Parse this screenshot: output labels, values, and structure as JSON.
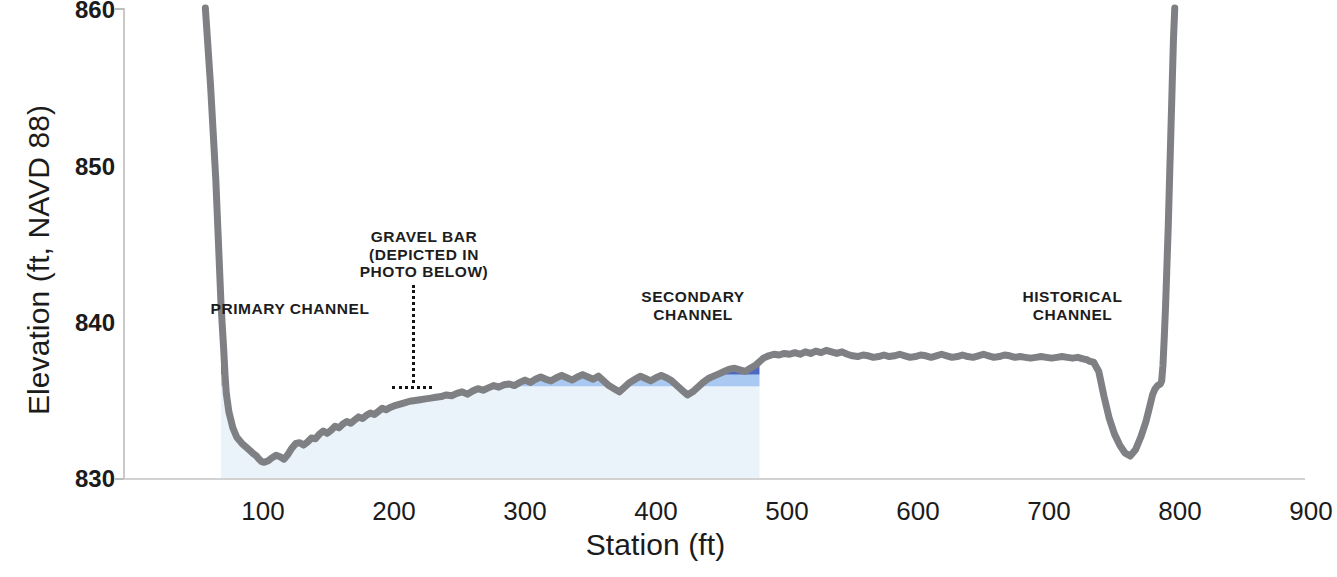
{
  "axes": {
    "y_title": "Elevation (ft, NAVD 88)",
    "x_title": "Station (ft)",
    "y_ticks": [
      "860",
      "850",
      "840",
      "830"
    ],
    "x_ticks": [
      "100",
      "200",
      "300",
      "400",
      "500",
      "600",
      "700",
      "800",
      "900"
    ]
  },
  "annotations": {
    "primary": "PRIMARY CHANNEL",
    "gravel_bar": "GRAVEL BAR\n(DEPICTED IN\nPHOTO BELOW)",
    "secondary": "SECONDARY\nCHANNEL",
    "historical": "HISTORICAL\nCHANNEL"
  },
  "colors": {
    "ground_line": "#7f8083",
    "water_top_navy": "#2d3357",
    "water_mid_blue": "#4a68c4",
    "water_light_blue": "#a9c8f2",
    "water_pale_blue": "#eaf2fa",
    "axis": "#c9c9c9",
    "text": "#1b1b1b"
  },
  "chart_data": {
    "type": "area",
    "title": "",
    "xlabel": "Station (ft)",
    "ylabel": "Elevation (ft, NAVD 88)",
    "xlim": [
      50,
      900
    ],
    "ylim": [
      830,
      860
    ],
    "grid": false,
    "legend": "none",
    "water_surface_elevations": {
      "navy_top": 837.9,
      "navy_bottom": 837.45,
      "mid_blue_bottom": 836.6,
      "light_blue_bottom": 835.85
    },
    "series": [
      {
        "name": "Ground surface (cross-section)",
        "x": [
          56,
          60,
          64,
          66,
          68,
          70,
          71,
          72,
          74,
          77,
          80,
          84,
          88,
          92,
          95,
          97,
          99,
          101,
          104,
          107,
          110,
          113,
          116,
          119,
          122,
          125,
          128,
          131,
          134,
          137,
          140,
          143,
          146,
          149,
          152,
          155,
          158,
          161,
          164,
          167,
          170,
          173,
          176,
          179,
          182,
          185,
          188,
          191,
          194,
          197,
          200,
          204,
          208,
          212,
          216,
          220,
          224,
          228,
          232,
          236,
          240,
          244,
          248,
          252,
          256,
          260,
          264,
          268,
          272,
          276,
          280,
          284,
          288,
          292,
          296,
          300,
          304,
          308,
          312,
          316,
          320,
          324,
          328,
          332,
          336,
          340,
          344,
          348,
          352,
          356,
          360,
          364,
          368,
          372,
          376,
          380,
          384,
          388,
          392,
          396,
          400,
          404,
          408,
          412,
          416,
          420,
          424,
          428,
          432,
          436,
          440,
          444,
          448,
          452,
          456,
          460,
          464,
          468,
          472,
          476,
          478,
          480,
          482,
          486,
          490,
          494,
          498,
          502,
          506,
          510,
          514,
          518,
          522,
          526,
          530,
          534,
          538,
          542,
          546,
          550,
          554,
          558,
          562,
          566,
          570,
          574,
          578,
          582,
          586,
          590,
          594,
          598,
          602,
          606,
          610,
          614,
          618,
          622,
          626,
          630,
          634,
          638,
          642,
          646,
          650,
          654,
          658,
          662,
          666,
          670,
          674,
          678,
          682,
          686,
          690,
          694,
          698,
          702,
          706,
          710,
          714,
          718,
          722,
          726,
          729,
          731,
          734,
          738,
          742,
          746,
          750,
          754,
          758,
          762,
          766,
          770,
          774,
          777,
          779,
          781,
          783,
          785,
          786,
          787,
          788,
          789,
          790,
          791,
          792,
          793,
          794,
          795,
          796
        ],
        "y": [
          860.0,
          855.0,
          849.0,
          845.0,
          841.0,
          838.2,
          836.6,
          835.4,
          834.2,
          833.2,
          832.6,
          832.2,
          831.9,
          831.6,
          831.4,
          831.2,
          831.05,
          831.0,
          831.1,
          831.3,
          831.45,
          831.35,
          831.2,
          831.5,
          831.9,
          832.2,
          832.25,
          832.1,
          832.3,
          832.55,
          832.5,
          832.8,
          833.0,
          832.85,
          833.05,
          833.3,
          833.2,
          833.45,
          833.6,
          833.5,
          833.7,
          833.9,
          833.8,
          834.0,
          834.15,
          834.05,
          834.25,
          834.45,
          834.35,
          834.5,
          834.6,
          834.7,
          834.8,
          834.9,
          834.95,
          835.0,
          835.05,
          835.1,
          835.15,
          835.2,
          835.3,
          835.25,
          835.4,
          835.5,
          835.35,
          835.55,
          835.7,
          835.6,
          835.75,
          835.9,
          835.8,
          835.95,
          836.0,
          835.9,
          836.1,
          836.25,
          836.1,
          836.3,
          836.45,
          836.3,
          836.2,
          836.4,
          836.55,
          836.4,
          836.25,
          836.45,
          836.6,
          836.45,
          836.3,
          836.5,
          836.2,
          835.9,
          835.7,
          835.5,
          835.8,
          836.1,
          836.3,
          836.5,
          836.35,
          836.2,
          836.4,
          836.55,
          836.4,
          836.2,
          835.9,
          835.6,
          835.3,
          835.5,
          835.8,
          836.1,
          836.35,
          836.5,
          836.65,
          836.8,
          836.95,
          837.0,
          836.9,
          836.8,
          837.0,
          837.2,
          837.35,
          837.5,
          837.65,
          837.8,
          837.9,
          837.85,
          837.95,
          837.9,
          838.0,
          837.9,
          838.05,
          837.95,
          838.1,
          838.0,
          838.15,
          838.05,
          837.95,
          838.05,
          837.9,
          837.8,
          837.75,
          837.85,
          837.8,
          837.7,
          837.75,
          837.85,
          837.75,
          837.8,
          837.9,
          837.8,
          837.7,
          837.75,
          837.85,
          837.8,
          837.7,
          837.8,
          837.9,
          837.8,
          837.7,
          837.75,
          837.85,
          837.75,
          837.7,
          837.8,
          837.9,
          837.8,
          837.7,
          837.75,
          837.85,
          837.8,
          837.7,
          837.75,
          837.7,
          837.65,
          837.7,
          837.75,
          837.7,
          837.65,
          837.7,
          837.75,
          837.7,
          837.65,
          837.7,
          837.6,
          837.55,
          837.45,
          837.4,
          836.8,
          835.2,
          833.8,
          832.8,
          832.1,
          831.6,
          831.4,
          831.8,
          832.6,
          833.6,
          834.6,
          835.3,
          835.7,
          835.9,
          836.0,
          836.2,
          837.2,
          839.0,
          841.0,
          843.5,
          846.0,
          849.0,
          852.0,
          855.0,
          858.0,
          860.0
        ]
      }
    ],
    "features": [
      {
        "name": "PRIMARY CHANNEL",
        "station_range": [
          70,
          400
        ]
      },
      {
        "name": "GRAVEL BAR (DEPICTED IN PHOTO BELOW)",
        "station": 218
      },
      {
        "name": "SECONDARY CHANNEL",
        "station_range": [
          405,
          478
        ]
      },
      {
        "name": "HISTORICAL CHANNEL",
        "station_range": [
          730,
          780
        ]
      }
    ]
  }
}
